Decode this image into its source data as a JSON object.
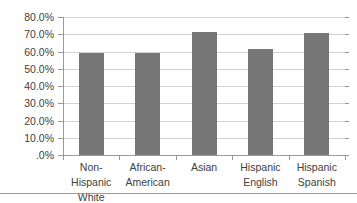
{
  "chart_data": {
    "type": "bar",
    "title": "",
    "subtitle": "",
    "xlabel": "",
    "ylabel": "",
    "categories": [
      "Non-Hispanic White",
      "African-American",
      "Asian",
      "Hispanic English",
      "Hispanic Spanish"
    ],
    "category_lines": [
      [
        "Non-Hispanic",
        "White"
      ],
      [
        "African-",
        "American"
      ],
      [
        "Asian",
        ""
      ],
      [
        "Hispanic",
        "English"
      ],
      [
        "Hispanic",
        "Spanish"
      ]
    ],
    "values": [
      59.0,
      59.0,
      71.5,
      61.5,
      71.0
    ],
    "ylim": [
      0,
      80
    ],
    "ytick_values": [
      80,
      70,
      60,
      50,
      40,
      30,
      20,
      10,
      0
    ],
    "ytick_labels": [
      "80.0%",
      "70.0%",
      "60.0%",
      "50.0%",
      "40.0%",
      "30.0%",
      "20.0%",
      "10.0%",
      ".0%"
    ],
    "grid": true,
    "legend": false,
    "legend_position": "none",
    "orientation": "vertical",
    "series": [
      {
        "name": "",
        "values": [
          59.0,
          59.0,
          71.5,
          61.5,
          71.0
        ]
      }
    ]
  },
  "style": {
    "bar_color": "#767676",
    "gridline_color": "#d2d2d2",
    "axis_color": "#9a9a9a",
    "text_color": "#404040",
    "background_color": "#ffffff",
    "rule_color": "#9b9b9b"
  }
}
